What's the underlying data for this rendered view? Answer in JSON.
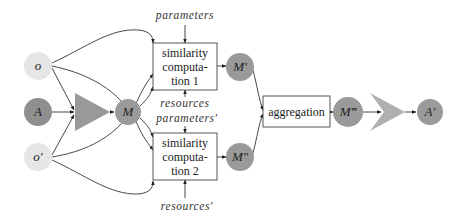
{
  "diagram": {
    "type": "flow-diagram",
    "nodes": {
      "o": {
        "label": "o",
        "color": "#e6e6e6"
      },
      "A": {
        "label": "A",
        "color": "#8f8f8f"
      },
      "o_prime": {
        "label": "o′",
        "color": "#e6e6e6"
      },
      "M": {
        "label": "M",
        "color": "#9a9a9a"
      },
      "M_prime": {
        "label": "M′",
        "color": "#9a9a9a"
      },
      "M_double_prime": {
        "label": "M″",
        "color": "#9a9a9a"
      },
      "M_triple_prime": {
        "label": "M‴",
        "color": "#9a9a9a"
      },
      "A_prime": {
        "label": "A′",
        "color": "#9a9a9a"
      }
    },
    "boxes": {
      "sim1": {
        "lines": [
          "similarity",
          "computa-",
          "tion 1"
        ]
      },
      "sim2": {
        "lines": [
          "similarity",
          "computa-",
          "tion 2"
        ]
      },
      "aggregation": {
        "label": "aggregation"
      }
    },
    "inputs": {
      "parameters": "parameters",
      "resources": "resources",
      "parameters_prime": "parameters′",
      "resources_prime": "resources′"
    },
    "operators": {
      "matcher": {
        "shape": "triangle",
        "color": "#999999"
      },
      "extractor": {
        "shape": "chevron",
        "color": "#b0b0b0"
      }
    }
  }
}
